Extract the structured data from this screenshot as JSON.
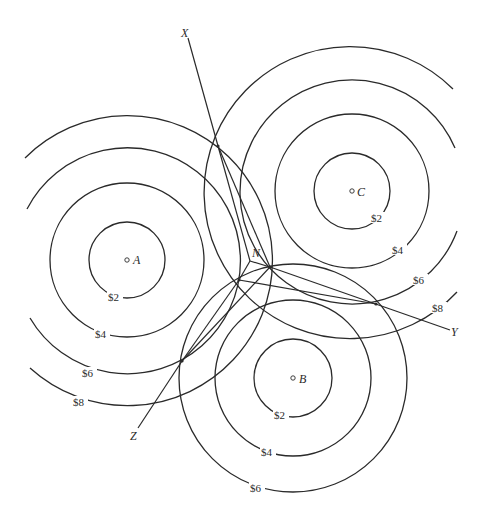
{
  "diagram": {
    "points": [
      {
        "id": "A",
        "label": "A",
        "x": 127,
        "y": 260
      },
      {
        "id": "B",
        "label": "B",
        "x": 293,
        "y": 378
      },
      {
        "id": "C",
        "label": "C",
        "x": 352,
        "y": 191
      },
      {
        "id": "N",
        "label": "N",
        "x": 250,
        "y": 261
      }
    ],
    "line_labels": {
      "X": "X",
      "Y": "Y",
      "Z": "Z",
      "N": "N"
    },
    "contours": {
      "A": {
        "c2": "$2",
        "c4": "$4",
        "c6": "$6",
        "c8": "$8"
      },
      "B": {
        "c2": "$2",
        "c4": "$4",
        "c6": "$6"
      },
      "C": {
        "c2": "$2",
        "c4": "$4",
        "c6": "$6",
        "c8": "$8"
      }
    },
    "radii": {
      "c2": 38,
      "c4": 77,
      "c6": 113,
      "c8": 146
    },
    "colors": {
      "stroke": "#2a2a2a",
      "background": "#ffffff"
    }
  }
}
